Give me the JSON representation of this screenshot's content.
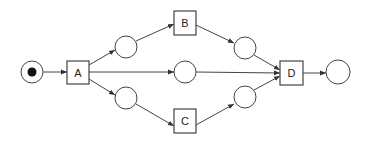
{
  "diagram": {
    "type": "petri-net",
    "colors": {
      "stroke": "#444444",
      "fill": "#ffffff",
      "token": "#111111",
      "background": "#ffffff"
    },
    "places": [
      {
        "id": "p_start",
        "cx": 32,
        "cy": 72,
        "r": 11,
        "tokens": 1
      },
      {
        "id": "p1",
        "cx": 126,
        "cy": 47,
        "r": 11,
        "tokens": 0
      },
      {
        "id": "p2",
        "cx": 185,
        "cy": 72,
        "r": 11,
        "tokens": 0
      },
      {
        "id": "p3",
        "cx": 126,
        "cy": 98,
        "r": 11,
        "tokens": 0
      },
      {
        "id": "p4",
        "cx": 245,
        "cy": 48,
        "r": 11,
        "tokens": 0
      },
      {
        "id": "p5",
        "cx": 245,
        "cy": 97,
        "r": 11,
        "tokens": 0
      },
      {
        "id": "p_end",
        "cx": 338,
        "cy": 72,
        "r": 12,
        "tokens": 0
      }
    ],
    "transitions": [
      {
        "id": "A",
        "label": "A",
        "x": 67,
        "y": 61,
        "w": 22,
        "h": 23
      },
      {
        "id": "B",
        "label": "B",
        "x": 174,
        "y": 11,
        "w": 22,
        "h": 24
      },
      {
        "id": "C",
        "label": "C",
        "x": 174,
        "y": 109,
        "w": 22,
        "h": 24
      },
      {
        "id": "D",
        "label": "D",
        "x": 280,
        "y": 61,
        "w": 23,
        "h": 24
      }
    ],
    "arcs": [
      {
        "from": "p_start",
        "to": "A",
        "x1": 43,
        "y1": 72,
        "x2": 67,
        "y2": 72
      },
      {
        "from": "A",
        "to": "p1",
        "x1": 89,
        "y1": 65,
        "x2": 115,
        "y2": 50
      },
      {
        "from": "A",
        "to": "p2",
        "x1": 89,
        "y1": 72,
        "x2": 174,
        "y2": 72
      },
      {
        "from": "A",
        "to": "p3",
        "x1": 89,
        "y1": 79,
        "x2": 115,
        "y2": 95
      },
      {
        "from": "p1",
        "to": "B",
        "x1": 136,
        "y1": 41,
        "x2": 174,
        "y2": 24
      },
      {
        "from": "p3",
        "to": "C",
        "x1": 136,
        "y1": 104,
        "x2": 174,
        "y2": 126
      },
      {
        "from": "B",
        "to": "p4",
        "x1": 196,
        "y1": 25,
        "x2": 234,
        "y2": 43
      },
      {
        "from": "C",
        "to": "p5",
        "x1": 196,
        "y1": 125,
        "x2": 234,
        "y2": 104
      },
      {
        "from": "p4",
        "to": "D",
        "x1": 254,
        "y1": 55,
        "x2": 280,
        "y2": 70
      },
      {
        "from": "p2",
        "to": "D",
        "x1": 196,
        "y1": 72,
        "x2": 280,
        "y2": 73
      },
      {
        "from": "p5",
        "to": "D",
        "x1": 254,
        "y1": 90,
        "x2": 280,
        "y2": 76
      },
      {
        "from": "D",
        "to": "p_end",
        "x1": 303,
        "y1": 73,
        "x2": 326,
        "y2": 73
      }
    ]
  }
}
